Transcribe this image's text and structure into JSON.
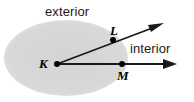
{
  "figure": {
    "name": "angle-interior-exterior-diagram",
    "width": 194,
    "height": 102,
    "background_color": "#ffffff"
  },
  "region_labels": {
    "exterior": "exterior",
    "interior": "interior"
  },
  "point_labels": {
    "vertex": "K",
    "upper_ray_point": "L",
    "lower_ray_point": "M"
  },
  "colors": {
    "shaded_region": "#d9d9d9",
    "ray_stroke": "#1a1a1a",
    "point_fill": "#000000",
    "text": "#1a1a1a"
  },
  "geometry": {
    "ellipse": {
      "cx": 66,
      "cy": 58,
      "rx": 62,
      "ry": 38
    },
    "vertex_K": {
      "x": 57,
      "y": 64
    },
    "point_L": {
      "x": 113,
      "y": 40
    },
    "point_M": {
      "x": 122,
      "y": 64
    },
    "ray_KL_tip": {
      "x": 162,
      "y": 24
    },
    "ray_KM_tip": {
      "x": 175,
      "y": 64
    }
  }
}
